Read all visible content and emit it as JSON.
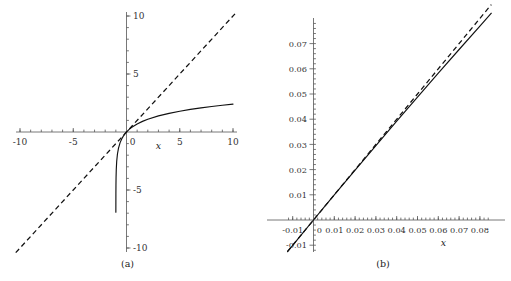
{
  "figure": {
    "background": "#ffffff",
    "ink_color": "#111111",
    "axis_color": "#555555"
  },
  "panels": [
    {
      "id": "a",
      "caption": "(a)",
      "axis_label_x": "x",
      "x_ticklabels": [
        "-10",
        "-5",
        "0",
        "5",
        "10"
      ],
      "y_ticklabels": [
        "10",
        "5",
        "-5",
        "-10"
      ],
      "chart_data": {
        "type": "line",
        "title": "",
        "xlabel": "x",
        "ylabel": "",
        "xlim": [
          -10,
          10
        ],
        "ylim": [
          -10,
          10
        ],
        "xticks": [
          -10,
          -5,
          0,
          5,
          10
        ],
        "yticks": [
          10,
          5,
          -5,
          -10
        ],
        "minor_tick_step": 1,
        "grid": false,
        "legend": "none",
        "axes_style": "centered-spines",
        "series": [
          {
            "name": "log(1+x)",
            "style": "solid",
            "x": [
              -0.999,
              -0.995,
              -0.99,
              -0.98,
              -0.96,
              -0.92,
              -0.85,
              -0.75,
              -0.6,
              -0.45,
              -0.3,
              -0.2,
              -0.1,
              0,
              0.25,
              0.5,
              1,
              1.5,
              2,
              3,
              4,
              5,
              6,
              7,
              8,
              9,
              10
            ],
            "y": [
              -6.908,
              -5.298,
              -4.605,
              -3.912,
              -3.219,
              -2.526,
              -1.897,
              -1.386,
              -0.916,
              -0.598,
              -0.357,
              -0.223,
              -0.105,
              0,
              0.223,
              0.405,
              0.693,
              0.916,
              1.099,
              1.386,
              1.609,
              1.792,
              1.946,
              2.079,
              2.197,
              2.303,
              2.398
            ]
          },
          {
            "name": "y = x",
            "style": "dashed",
            "x": [
              -10.4,
              10.4
            ],
            "y": [
              -10.4,
              10.4
            ]
          }
        ]
      }
    },
    {
      "id": "b",
      "caption": "(b)",
      "axis_label_x": "x",
      "x_ticklabels": [
        "-0.01",
        "0",
        "0.01",
        "0.02",
        "0.03",
        "0.04",
        "0.05",
        "0.06",
        "0.07",
        "0.08"
      ],
      "y_ticklabels": [
        "0.07",
        "0.06",
        "0.05",
        "0.04",
        "0.03",
        "0.02",
        "0.01",
        "-0.01"
      ],
      "chart_data": {
        "type": "line",
        "title": "",
        "xlabel": "x",
        "ylabel": "",
        "xlim": [
          -0.0125,
          0.0855
        ],
        "ylim": [
          -0.0135,
          0.0785
        ],
        "xticks": [
          -0.01,
          0,
          0.01,
          0.02,
          0.03,
          0.04,
          0.05,
          0.06,
          0.07,
          0.08
        ],
        "yticks": [
          0.07,
          0.06,
          0.05,
          0.04,
          0.03,
          0.02,
          0.01,
          -0.01
        ],
        "minor_tick_step": 0.002,
        "grid": false,
        "legend": "none",
        "axes_style": "centered-spines",
        "series": [
          {
            "name": "log(1+x)",
            "style": "solid",
            "x": [
              -0.0125,
              -0.01,
              -0.005,
              0,
              0.005,
              0.01,
              0.02,
              0.03,
              0.04,
              0.05,
              0.06,
              0.07,
              0.08,
              0.0855
            ],
            "y": [
              -0.012579,
              -0.01005,
              -0.005013,
              0,
              0.0049875,
              0.00995,
              0.019803,
              0.029559,
              0.039221,
              0.04879,
              0.058269,
              0.067659,
              0.076961,
              0.082048
            ]
          },
          {
            "name": "y = x",
            "style": "dashed",
            "x": [
              -0.0125,
              0.0855
            ],
            "y": [
              -0.0125,
              0.0855
            ]
          }
        ]
      }
    }
  ]
}
